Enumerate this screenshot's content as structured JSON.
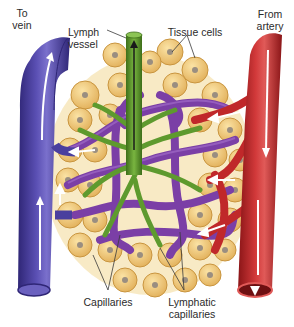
{
  "figure": {
    "type": "anatomical-diagram"
  },
  "labels": {
    "to_vein": [
      "To",
      "vein"
    ],
    "lymph_vessel": [
      "Lymph",
      "vessel"
    ],
    "tissue_cells": "Tissue cells",
    "from_artery": [
      "From",
      "artery"
    ],
    "capillaries": "Capillaries",
    "lymphatic_capillaries": [
      "Lymphatic",
      "capillaries"
    ]
  },
  "colors": {
    "vein": "#4a3f9e",
    "vein_dark": "#2f2676",
    "artery": "#c0282a",
    "artery_dark": "#8a1517",
    "lymph": "#5e9a2e",
    "lymph_dark": "#3e6e1a",
    "capillary_purple": "#7b3fa6",
    "cell_fill": "#efc777",
    "cell_edge": "#c9953f",
    "nucleus": "#9a8e80",
    "flow_arrow": "#ffffff"
  }
}
